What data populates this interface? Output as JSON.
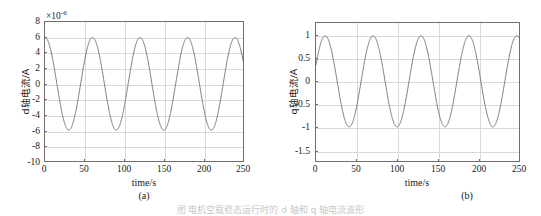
{
  "figure": {
    "caption": "图 电机空载稳态运行时的 d 轴和 q 轴电流波形",
    "background_color": "#ffffff",
    "curve_color": "#6b6b6b",
    "axis_color": "#6e6e6e",
    "grid_color": "#d9d9d9"
  },
  "chart_data": [
    {
      "type": "line",
      "panel_id": "a",
      "sublabel": "(a)",
      "title": "",
      "xlabel": "time/s",
      "ylabel": "d轴电流/A",
      "y_exponent_prefix": "×10",
      "y_exponent_value": "-6",
      "xlim": [
        0,
        250
      ],
      "ylim": [
        -10,
        8
      ],
      "xticks": [
        0,
        50,
        100,
        150,
        200,
        250
      ],
      "xticklabels": [
        "0",
        "50",
        "100",
        "150",
        "200",
        "250"
      ],
      "yticks": [
        -10,
        -8,
        -6,
        -4,
        -2,
        0,
        2,
        4,
        6,
        8
      ],
      "yticklabels": [
        "-10",
        "-8",
        "-6",
        "-4",
        "-2",
        "0",
        "2",
        "4",
        "6",
        "8"
      ],
      "grid": true,
      "legend": null,
      "series": [
        {
          "name": "d轴电流",
          "waveform": "cosine",
          "amplitude": 6,
          "offset": 0,
          "period": 60,
          "phase_deg": 0,
          "x_start": 0,
          "x_end": 250,
          "peaks_at": [
            0,
            60,
            120,
            180,
            240
          ],
          "troughs_at": [
            30,
            90,
            150,
            210
          ],
          "peak_value": 6,
          "trough_value": -6,
          "start_value": 6
        }
      ]
    },
    {
      "type": "line",
      "panel_id": "b",
      "sublabel": "(b)",
      "title": "",
      "xlabel": "time/s",
      "ylabel": "q轴电流/A",
      "y_exponent_prefix": "",
      "y_exponent_value": "",
      "xlim": [
        0,
        250
      ],
      "ylim": [
        -1.75,
        1.28
      ],
      "xticks": [
        0,
        50,
        100,
        150,
        200,
        250
      ],
      "xticklabels": [
        "0",
        "50",
        "100",
        "150",
        "200",
        "250"
      ],
      "yticks": [
        -1.5,
        -1,
        -0.5,
        0,
        0.5,
        1
      ],
      "yticklabels": [
        "-1.5",
        "-1",
        "-0.5",
        "0",
        "0.5",
        "1"
      ],
      "grid": true,
      "legend": null,
      "series": [
        {
          "name": "q轴电流",
          "waveform": "sine",
          "amplitude": 1,
          "offset": 0,
          "period": 59,
          "phase_deg": 21,
          "x_start": 0,
          "x_end": 250,
          "peaks_at": [
            15,
            74,
            133,
            192
          ],
          "troughs_at": [
            44,
            103,
            163,
            222
          ],
          "peak_value": 1,
          "trough_value": -1,
          "start_value": 0.35
        }
      ]
    }
  ]
}
